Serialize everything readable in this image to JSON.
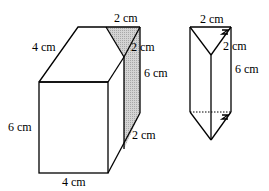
{
  "figures": [
    {
      "name": "cuboid-with-triangular-prism-cut",
      "labels": {
        "top_length": "2 cm",
        "slant_depth": "4 cm",
        "triangle_side": "2 cm",
        "shaded_height": "6 cm",
        "front_height": "6 cm",
        "front_width": "4 cm",
        "bottom_slant": "2 cm"
      },
      "shading_color": "#c8c8c8"
    },
    {
      "name": "triangular-prism",
      "labels": {
        "top_length": "2 cm",
        "triangle_side": "2 cm",
        "height": "6 cm"
      }
    }
  ]
}
